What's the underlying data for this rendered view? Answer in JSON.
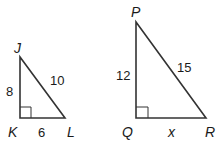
{
  "diagram": {
    "triangles": [
      {
        "name": "JKL",
        "vertices": {
          "J": "J",
          "K": "K",
          "L": "L"
        },
        "right_angle_at": "K",
        "sides": {
          "JK": "8",
          "KL": "6",
          "JL": "10"
        }
      },
      {
        "name": "PQR",
        "vertices": {
          "P": "P",
          "Q": "Q",
          "R": "R"
        },
        "right_angle_at": "Q",
        "sides": {
          "PQ": "12",
          "QR": "x",
          "PR": "15"
        }
      }
    ],
    "colors": {
      "stroke": "#333333",
      "text": "#1a1a1a",
      "background": "#ffffff"
    }
  }
}
